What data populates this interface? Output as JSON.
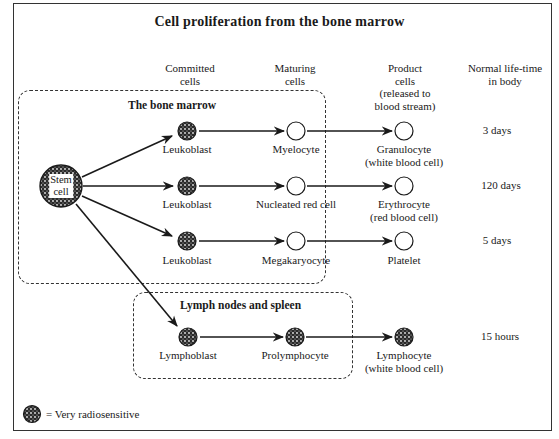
{
  "title": "Cell proliferation from the bone marrow",
  "column_headers": [
    {
      "label": "Committed\ncells"
    },
    {
      "label": "Maturing\ncells"
    },
    {
      "label": "Product\ncells\n(released to\nblood stream)"
    },
    {
      "label": "Normal life-time\nin body"
    }
  ],
  "regions": {
    "bone_marrow": {
      "title": "The bone marrow"
    },
    "lymph": {
      "title": "Lymph nodes and spleen"
    }
  },
  "stem_cell": {
    "label": "Stem\ncell",
    "radiosensitive": true
  },
  "rows": [
    {
      "committed": {
        "label": "Leukoblast",
        "radiosensitive": true
      },
      "maturing": {
        "label": "Myelocyte",
        "radiosensitive": false
      },
      "product": {
        "label": "Granulocyte\n(white blood cell)",
        "radiosensitive": false
      },
      "lifetime": "3 days"
    },
    {
      "committed": {
        "label": "Leukoblast",
        "radiosensitive": true
      },
      "maturing": {
        "label": "Nucleated red cell",
        "radiosensitive": false
      },
      "product": {
        "label": "Erythrocyte\n(red blood cell)",
        "radiosensitive": false
      },
      "lifetime": "120 days"
    },
    {
      "committed": {
        "label": "Leukoblast",
        "radiosensitive": true
      },
      "maturing": {
        "label": "Megakaryocyte",
        "radiosensitive": false
      },
      "product": {
        "label": "Platelet",
        "radiosensitive": false
      },
      "lifetime": "5 days"
    },
    {
      "committed": {
        "label": "Lymphoblast",
        "radiosensitive": true
      },
      "maturing": {
        "label": "Prolymphocyte",
        "radiosensitive": true
      },
      "product": {
        "label": "Lymphocyte\n(white blood cell)",
        "radiosensitive": true
      },
      "lifetime": "15 hours"
    }
  ],
  "legend": {
    "icon": "stippled-cell-icon",
    "text": "= Very radiosensitive"
  },
  "colors": {
    "ink": "#1a1a1a",
    "background": "#ffffff"
  }
}
